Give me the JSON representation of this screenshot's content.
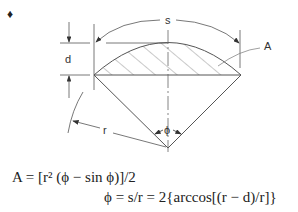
{
  "diagram": {
    "bullet": "♦",
    "labels": {
      "s": "s",
      "d": "d",
      "A": "A",
      "r": "r",
      "phi": "ϕ"
    }
  },
  "formulas": {
    "area": "A = [r² (ϕ − sin ϕ)]/2",
    "angle": "ϕ = s/r = 2{arccos[(r − d)/r]}"
  },
  "colors": {
    "line": "#555555",
    "text": "#222222",
    "background": "#ffffff"
  }
}
